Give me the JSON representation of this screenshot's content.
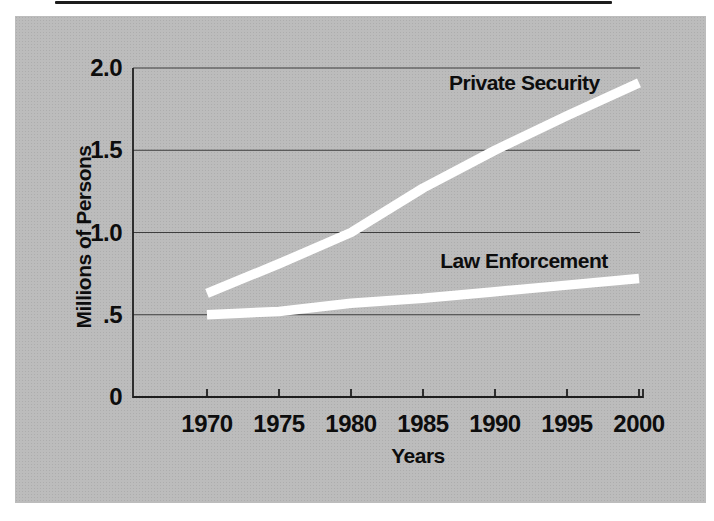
{
  "figure": {
    "panel_bg": "#bcbcbc",
    "line_color": "#ffffff",
    "grid_color": "#3d3d3d",
    "axis_color": "#1e1e1e",
    "text_color": "#0d0d0d"
  },
  "chart_data": {
    "type": "line",
    "title": "",
    "xlabel": "Years",
    "ylabel": "Millions of Persons",
    "x": [
      1970,
      1975,
      1980,
      1985,
      1990,
      1995,
      2000
    ],
    "xtick_labels": [
      "1970",
      "1975",
      "1980",
      "1985",
      "1990",
      "1995",
      "2000"
    ],
    "ytick_values": [
      0,
      0.5,
      1.0,
      1.5,
      2.0
    ],
    "ytick_labels": [
      "0",
      ".5",
      "1.0",
      "1.5",
      "2.0"
    ],
    "ylim": [
      0,
      2.0
    ],
    "grid": "horizontal gridlines at each y tick",
    "legend_position": "labels annotated beside lines",
    "series": [
      {
        "name": "Private Security",
        "values": [
          0.63,
          0.81,
          1.0,
          1.27,
          1.5,
          1.71,
          1.91
        ]
      },
      {
        "name": "Law Enforcement",
        "values": [
          0.5,
          0.52,
          0.57,
          0.6,
          0.64,
          0.68,
          0.72
        ]
      }
    ]
  }
}
